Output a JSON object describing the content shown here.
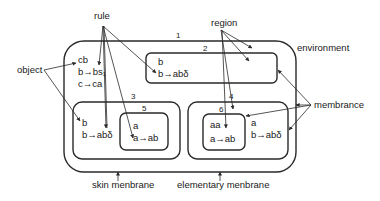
{
  "diagram": {
    "title_labels": {
      "rule": "rule",
      "region": "region",
      "object": "object",
      "environment": "environment",
      "membrance": "membrance",
      "skin_membrane": "skin menbrane",
      "elementary_membrane": "elementary menbrane"
    },
    "membranes": [
      {
        "id": "1",
        "label": "1",
        "objects": "cb",
        "rules": [
          "b→bs₁",
          "c→ca"
        ]
      },
      {
        "id": "2",
        "label": "2",
        "objects": "b",
        "rules": [
          "b→abδ"
        ]
      },
      {
        "id": "3",
        "label": "3",
        "objects": "b",
        "rules": [
          "b→abδ"
        ]
      },
      {
        "id": "4",
        "label": "4",
        "objects": "a",
        "rules": [
          "b→abδ"
        ]
      },
      {
        "id": "5",
        "label": "5",
        "objects": "a",
        "rules": [
          "a→ab"
        ]
      },
      {
        "id": "6",
        "label": "6",
        "objects": "aa",
        "rules": [
          "a→ab"
        ]
      }
    ],
    "colors": {
      "stroke": "#2a2a2a",
      "text": "#1a1a1a",
      "background": "#ffffff"
    }
  }
}
